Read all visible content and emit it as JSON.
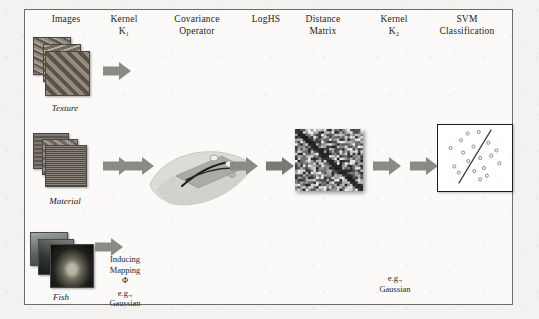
{
  "figure": {
    "background_color": "#f3f2f0",
    "frame_color": "#6e6c68",
    "band_pale_color": "#f0efec",
    "band_gray_color": "#d6d5d1",
    "arrow_color": "#8c8a85",
    "arrow_color_dark": "#7b7974"
  },
  "columns": [
    {
      "id": "images",
      "title_line1": "Images",
      "title_line2": ""
    },
    {
      "id": "kernel1",
      "title_line1": "Kernel",
      "title_line2": "K₁"
    },
    {
      "id": "covariance",
      "title_line1": "Covariance",
      "title_line2": "Operator"
    },
    {
      "id": "loghs",
      "title_line1": "LogHS",
      "title_line2": ""
    },
    {
      "id": "distance",
      "title_line1": "Distance",
      "title_line2": "Matrix"
    },
    {
      "id": "kernel2",
      "title_line1": "Kernel",
      "title_line2": "K₂"
    },
    {
      "id": "svm",
      "title_line1": "SVM",
      "title_line2": "Classification"
    }
  ],
  "dataset_rows": [
    {
      "id": "texture",
      "caption": "Texture"
    },
    {
      "id": "material",
      "caption": "Material"
    },
    {
      "id": "fish",
      "caption": "Fish"
    }
  ],
  "annotations": {
    "kernel1_note_line1": "Inducing",
    "kernel1_note_line2": "Mapping",
    "kernel1_note_line3": "Φ",
    "kernel1_note_line4": "e.g.,",
    "kernel1_note_line5": "Gaussian",
    "kernel2_note_line1": "e.g.,",
    "kernel2_note_line2": "Gaussian"
  },
  "svm_panel": {
    "points": [
      {
        "x": 22,
        "y": 54
      },
      {
        "x": 34,
        "y": 36
      },
      {
        "x": 17,
        "y": 30
      },
      {
        "x": 31,
        "y": 20
      },
      {
        "x": 41,
        "y": 47
      },
      {
        "x": 28,
        "y": 62
      },
      {
        "x": 40,
        "y": 11
      },
      {
        "x": 48,
        "y": 28
      },
      {
        "x": 55,
        "y": 9
      },
      {
        "x": 57,
        "y": 43
      },
      {
        "x": 49,
        "y": 60
      },
      {
        "x": 62,
        "y": 56
      },
      {
        "x": 68,
        "y": 23
      },
      {
        "x": 72,
        "y": 40
      },
      {
        "x": 66,
        "y": 66
      },
      {
        "x": 79,
        "y": 33
      },
      {
        "x": 83,
        "y": 50
      },
      {
        "x": 57,
        "y": 71
      }
    ],
    "boundary": {
      "x1": 28,
      "y1": 76,
      "x2": 72,
      "y2": 6
    },
    "point_color": "#8b8986",
    "boundary_color": "#3a3835"
  }
}
